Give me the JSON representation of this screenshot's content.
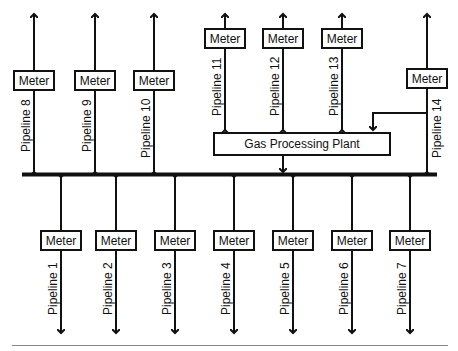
{
  "diagram": {
    "bus_label": "",
    "plant": {
      "label": "Gas Processing Plant"
    },
    "meter_label": "Meter",
    "top_pipelines": [
      {
        "name": "Pipeline 8",
        "meter": "Meter"
      },
      {
        "name": "Pipeline 9",
        "meter": "Meter"
      },
      {
        "name": "Pipeline 10",
        "meter": "Meter"
      },
      {
        "name": "Pipeline 11",
        "meter": "Meter",
        "feeds": "Gas Processing Plant"
      },
      {
        "name": "Pipeline 12",
        "meter": "Meter",
        "feeds": "Gas Processing Plant"
      },
      {
        "name": "Pipeline 13",
        "meter": "Meter",
        "feeds": "Gas Processing Plant"
      },
      {
        "name": "Pipeline 14",
        "meter": "Meter",
        "feeds": "Gas Processing Plant and header"
      }
    ],
    "bottom_pipelines": [
      {
        "name": "Pipeline 1",
        "meter": "Meter"
      },
      {
        "name": "Pipeline 2",
        "meter": "Meter"
      },
      {
        "name": "Pipeline 3",
        "meter": "Meter"
      },
      {
        "name": "Pipeline 4",
        "meter": "Meter"
      },
      {
        "name": "Pipeline 5",
        "meter": "Meter"
      },
      {
        "name": "Pipeline 6",
        "meter": "Meter"
      },
      {
        "name": "Pipeline 7",
        "meter": "Meter"
      }
    ]
  }
}
